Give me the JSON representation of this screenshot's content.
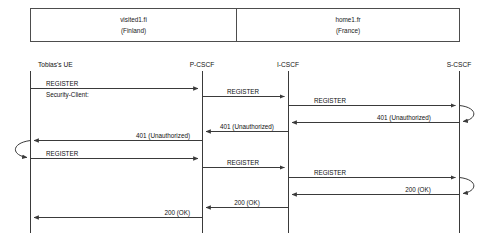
{
  "diagram": {
    "type": "sequence-diagram",
    "networks": [
      {
        "id": "visited",
        "domain": "visited1.fi",
        "country": "(Finland)"
      },
      {
        "id": "home",
        "domain": "home1.fr",
        "country": "(France)"
      }
    ],
    "lifelines": [
      {
        "id": "ue",
        "label": "Tobias's UE"
      },
      {
        "id": "pcscf",
        "label": "P-CSCF"
      },
      {
        "id": "icscf",
        "label": "I-CSCF"
      },
      {
        "id": "scscf",
        "label": "S-CSCF"
      }
    ],
    "messages": [
      {
        "seq": 1,
        "from": "ue",
        "to": "pcscf",
        "label": "REGISTER",
        "sublabel": "Security-Client:",
        "direction": "right"
      },
      {
        "seq": 2,
        "from": "pcscf",
        "to": "icscf",
        "label": "REGISTER",
        "direction": "right"
      },
      {
        "seq": 3,
        "from": "icscf",
        "to": "scscf",
        "label": "REGISTER",
        "direction": "right"
      },
      {
        "seq": 4,
        "from": "scscf",
        "to": "scscf",
        "label": "",
        "direction": "self"
      },
      {
        "seq": 5,
        "from": "scscf",
        "to": "icscf",
        "label": "401 (Unauthorized)",
        "direction": "left"
      },
      {
        "seq": 6,
        "from": "icscf",
        "to": "pcscf",
        "label": "401 (Unauthorized)",
        "direction": "left"
      },
      {
        "seq": 7,
        "from": "pcscf",
        "to": "ue",
        "label": "401 (Unauthorized)",
        "direction": "left"
      },
      {
        "seq": 8,
        "from": "ue",
        "to": "ue",
        "label": "",
        "direction": "self"
      },
      {
        "seq": 9,
        "from": "ue",
        "to": "pcscf",
        "label": "REGISTER",
        "direction": "right"
      },
      {
        "seq": 10,
        "from": "pcscf",
        "to": "icscf",
        "label": "REGISTER",
        "direction": "right"
      },
      {
        "seq": 11,
        "from": "icscf",
        "to": "scscf",
        "label": "REGISTER",
        "direction": "right"
      },
      {
        "seq": 12,
        "from": "scscf",
        "to": "scscf",
        "label": "",
        "direction": "self"
      },
      {
        "seq": 13,
        "from": "scscf",
        "to": "icscf",
        "label": "200 (OK)",
        "direction": "left"
      },
      {
        "seq": 14,
        "from": "icscf",
        "to": "pcscf",
        "label": "200 (OK)",
        "direction": "left"
      },
      {
        "seq": 15,
        "from": "pcscf",
        "to": "ue",
        "label": "200 (OK)",
        "direction": "left"
      }
    ],
    "colors": {
      "line": "#3a3a3a",
      "box_border": "#4d4d4d",
      "text": "#111111",
      "background": "#ffffff"
    }
  }
}
